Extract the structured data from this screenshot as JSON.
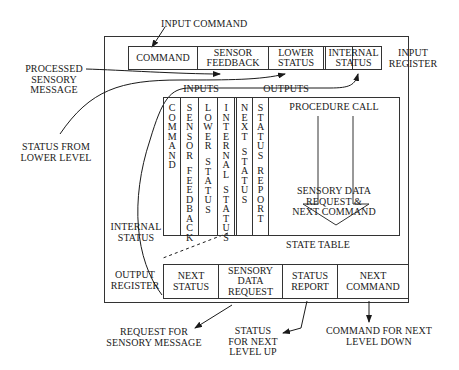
{
  "diagram": {
    "external_labels": {
      "input_command": "INPUT COMMAND",
      "processed_sensory_message": [
        "PROCESSED",
        "SENSORY",
        "MESSAGE"
      ],
      "status_from_lower_level": [
        "STATUS FROM",
        "LOWER LEVEL"
      ],
      "internal_status": [
        "INTERNAL",
        "STATUS"
      ],
      "request_for_sensory_message": [
        "REQUEST FOR",
        "SENSORY MESSAGE"
      ],
      "status_for_next_level_up": [
        "STATUS",
        "FOR NEXT",
        "LEVEL UP"
      ],
      "command_for_next_level_down": [
        "COMMAND FOR NEXT",
        "LEVEL DOWN"
      ]
    },
    "input_register": {
      "label": [
        "INPUT",
        "REGISTER"
      ],
      "cells": [
        {
          "text": [
            "COMMAND"
          ]
        },
        {
          "text": [
            "SENSOR",
            "FEEDBACK"
          ]
        },
        {
          "text": [
            "LOWER",
            "STATUS"
          ]
        },
        {
          "text": [
            "INTERNAL",
            "STATUS"
          ]
        }
      ]
    },
    "state_table": {
      "title": "STATE TABLE",
      "inputs_header": "INPUTS",
      "outputs_header": "OUTPUTS",
      "input_columns": [
        {
          "words": [
            "COMMAND"
          ]
        },
        {
          "words": [
            "SENSOR",
            "FEEDBACK"
          ]
        },
        {
          "words": [
            "LOWER",
            "STATUS"
          ]
        },
        {
          "words": [
            "INTERNAL",
            "STATUS"
          ]
        }
      ],
      "output_columns": [
        {
          "words": [
            "NEXT",
            "STATUS"
          ]
        },
        {
          "words": [
            "STATUS",
            "REPORT"
          ]
        }
      ],
      "procedure_call": "PROCEDURE CALL",
      "procedure_result": [
        "SENSORY DATA",
        "REQUEST &",
        "NEXT COMMAND"
      ]
    },
    "output_register": {
      "label": [
        "OUTPUT",
        "REGISTER"
      ],
      "cells": [
        {
          "text": [
            "NEXT",
            "STATUS"
          ]
        },
        {
          "text": [
            "SENSORY",
            "DATA",
            "REQUEST"
          ]
        },
        {
          "text": [
            "STATUS",
            "REPORT"
          ]
        },
        {
          "text": [
            "NEXT",
            "COMMAND"
          ]
        }
      ]
    }
  }
}
